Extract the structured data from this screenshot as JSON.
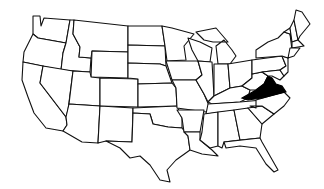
{
  "map": {
    "title": "",
    "region": "United States (contiguous)",
    "highlighted_state": "Virginia",
    "highlight_color": "#000000",
    "base_fill": "#ffffff",
    "outline_color": "#111111"
  }
}
